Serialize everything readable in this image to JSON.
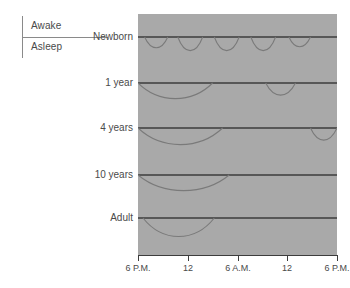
{
  "legend": {
    "awake_label": "Awake",
    "asleep_label": "Asleep"
  },
  "chart_data": {
    "type": "line",
    "title": "",
    "xlabel": "",
    "ylabel": "",
    "grid": false,
    "legend_position": "top-left",
    "plot_background_color": "#a9a9a9",
    "line_color": "#3c3c3c",
    "curve_color": "#7a7a7a",
    "x_axis": {
      "tick_labels": [
        "6 P.M.",
        "12",
        "6 A.M.",
        "12",
        "6 P.M."
      ],
      "tick_values": [
        0,
        6,
        12,
        18,
        24
      ],
      "range": [
        0,
        24
      ],
      "unit": "hours from 6 P.M."
    },
    "y_axis": {
      "categories": [
        "Newborn",
        "1 year",
        "4 years",
        "10 years",
        "Adult"
      ],
      "states": [
        "Awake",
        "Asleep"
      ]
    },
    "series": [
      {
        "name": "Newborn",
        "baseline_label": "Newborn",
        "pattern": "polyphasic",
        "sleep_episodes": [
          {
            "start": 0.8,
            "end": 3.6,
            "depth": 0.55
          },
          {
            "start": 4.8,
            "end": 7.8,
            "depth": 0.7
          },
          {
            "start": 9.2,
            "end": 12.2,
            "depth": 0.7
          },
          {
            "start": 13.6,
            "end": 16.6,
            "depth": 0.7
          },
          {
            "start": 18.2,
            "end": 20.8,
            "depth": 0.5
          }
        ]
      },
      {
        "name": "1 year",
        "baseline_label": "1 year",
        "pattern": "night sleep plus naps",
        "sleep_episodes": [
          {
            "start": 0.0,
            "end": 9.0,
            "depth": 0.8
          },
          {
            "start": 15.4,
            "end": 19.0,
            "depth": 0.62
          }
        ]
      },
      {
        "name": "4 years",
        "baseline_label": "4 years",
        "pattern": "night sleep plus one nap",
        "sleep_episodes": [
          {
            "start": 0.0,
            "end": 10.2,
            "depth": 0.85
          },
          {
            "start": 20.8,
            "end": 24.0,
            "depth": 0.62
          }
        ]
      },
      {
        "name": "10 years",
        "baseline_label": "10 years",
        "pattern": "consolidated night sleep",
        "sleep_episodes": [
          {
            "start": 0.0,
            "end": 11.0,
            "depth": 0.8
          }
        ]
      },
      {
        "name": "Adult",
        "baseline_label": "Adult",
        "pattern": "consolidated night sleep",
        "sleep_episodes": [
          {
            "start": 0.6,
            "end": 9.2,
            "depth": 0.95
          }
        ]
      }
    ]
  }
}
